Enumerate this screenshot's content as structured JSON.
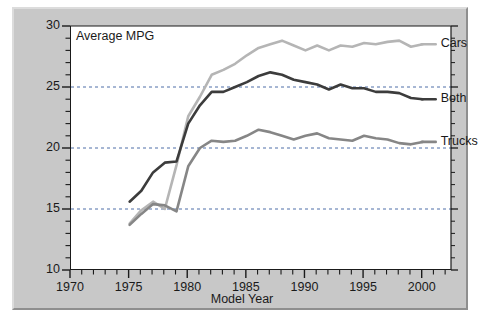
{
  "chart_data": {
    "type": "line",
    "title": "Average MPG",
    "xlabel": "Model Year",
    "ylabel": "",
    "xlim": [
      1970,
      2002.5
    ],
    "ylim": [
      10,
      30
    ],
    "xticks": [
      1970,
      1975,
      1980,
      1985,
      1990,
      1995,
      2000
    ],
    "xtick_labels": [
      "1970",
      "1975",
      "1980",
      "1985",
      "1990",
      "1995",
      "2000"
    ],
    "yticks": [
      10,
      15,
      20,
      25,
      30
    ],
    "ytick_labels": [
      "10",
      "15",
      "20",
      "25",
      "30"
    ],
    "minor_tick_step_x": 1,
    "minor_tick_step_y": 1,
    "grid": "horizontal dashed gridlines at 15, 20, 25",
    "gridlines": [
      15,
      20,
      25
    ],
    "legend_position": "right of line ends, inline labels",
    "x": [
      1975,
      1976,
      1977,
      1978,
      1979,
      1980,
      1981,
      1982,
      1983,
      1984,
      1985,
      1986,
      1987,
      1988,
      1989,
      1990,
      1991,
      1992,
      1993,
      1994,
      1995,
      1996,
      1997,
      1998,
      1999,
      2000
    ],
    "series": [
      {
        "name": "Cars",
        "color": "#b5b5b5",
        "values": [
          13.8,
          14.9,
          15.6,
          15.0,
          18.6,
          22.6,
          24.2,
          26.0,
          26.4,
          26.9,
          27.6,
          28.2,
          28.5,
          28.8,
          28.4,
          28.0,
          28.4,
          28.0,
          28.4,
          28.3,
          28.6,
          28.5,
          28.7,
          28.8,
          28.3,
          28.5
        ]
      },
      {
        "name": "Both",
        "color": "#3c3c3c",
        "values": [
          15.6,
          16.5,
          18.0,
          18.8,
          18.9,
          22.0,
          23.5,
          24.6,
          24.6,
          25.0,
          25.4,
          25.9,
          26.2,
          26.0,
          25.6,
          25.4,
          25.2,
          24.8,
          25.2,
          24.9,
          24.9,
          24.6,
          24.6,
          24.5,
          24.1,
          24.0
        ]
      },
      {
        "name": "Trucks",
        "color": "#868686",
        "values": [
          13.7,
          14.6,
          15.4,
          15.3,
          14.8,
          18.5,
          20.0,
          20.6,
          20.5,
          20.6,
          21.0,
          21.5,
          21.3,
          21.0,
          20.7,
          21.0,
          21.2,
          20.8,
          20.7,
          20.6,
          21.0,
          20.8,
          20.7,
          20.4,
          20.3,
          20.5
        ]
      }
    ]
  },
  "labels": {
    "cars": "Cars",
    "both": "Both",
    "trucks": "Trucks"
  }
}
